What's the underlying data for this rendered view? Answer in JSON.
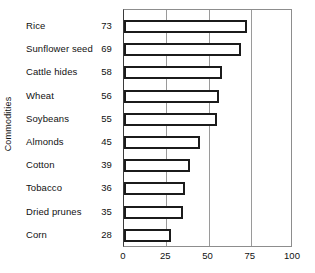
{
  "chart_data": {
    "type": "bar",
    "orientation": "horizontal",
    "title": "",
    "xlabel": "",
    "ylabel": "Commodities",
    "xlim": [
      0,
      100
    ],
    "xticks": [
      0,
      25,
      50,
      75,
      100
    ],
    "grid": true,
    "legend": null,
    "categories": [
      "Rice",
      "Sunflower seed",
      "Cattle hides",
      "Wheat",
      "Soybeans",
      "Almonds",
      "Cotton",
      "Tobacco",
      "Dried prunes",
      "Corn"
    ],
    "values": [
      73,
      69,
      58,
      56,
      55,
      45,
      39,
      36,
      35,
      28
    ],
    "value_labels": [
      "73",
      "69",
      "58",
      "56",
      "55",
      "45",
      "39",
      "36",
      "35",
      "28"
    ],
    "tick_labels": [
      "0",
      "25",
      "50",
      "75",
      "100"
    ],
    "colors": {
      "bar_fill": "#ffffff",
      "bar_outline": "#1b1b1b",
      "gridline": "#9a9a9a",
      "plot_border": "#8d8d8d",
      "text": "#111111",
      "background": "#ffffff"
    }
  }
}
